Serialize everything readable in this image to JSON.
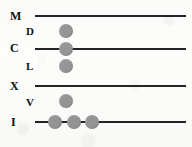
{
  "figure": {
    "name": "roman-numeral-abacus",
    "width": 192,
    "height": 147,
    "background_color": "#fdfdfb",
    "line_color": "#242424",
    "bead_color": "#969696",
    "label_color": "#121212"
  },
  "rows": [
    {
      "label": "M",
      "kind": "major",
      "has_line": true,
      "label_x": 10,
      "label_y": 10,
      "line": {
        "x": 35,
        "y": 15,
        "width": 151
      },
      "beads": []
    },
    {
      "label": "D",
      "kind": "minor",
      "has_line": false,
      "label_x": 26,
      "label_y": 26,
      "beads": [
        {
          "cx": 66,
          "cy": 31
        }
      ]
    },
    {
      "label": "C",
      "kind": "major",
      "has_line": true,
      "label_x": 10,
      "label_y": 42,
      "line": {
        "x": 35,
        "y": 48,
        "width": 151
      },
      "beads": [
        {
          "cx": 66,
          "cy": 49
        }
      ]
    },
    {
      "label": "L",
      "kind": "minor",
      "has_line": false,
      "label_x": 26,
      "label_y": 61,
      "beads": [
        {
          "cx": 66,
          "cy": 66
        }
      ]
    },
    {
      "label": "X",
      "kind": "major",
      "has_line": true,
      "label_x": 10,
      "label_y": 80,
      "line": {
        "x": 35,
        "y": 85,
        "width": 151
      },
      "beads": []
    },
    {
      "label": "V",
      "kind": "minor",
      "has_line": false,
      "label_x": 26,
      "label_y": 97,
      "beads": [
        {
          "cx": 66,
          "cy": 101
        }
      ]
    },
    {
      "label": "I",
      "kind": "major",
      "has_line": true,
      "label_x": 11,
      "label_y": 116,
      "line": {
        "x": 35,
        "y": 121,
        "width": 151
      },
      "beads": [
        {
          "cx": 55,
          "cy": 122
        },
        {
          "cx": 74,
          "cy": 122
        },
        {
          "cx": 92,
          "cy": 122
        }
      ]
    }
  ]
}
